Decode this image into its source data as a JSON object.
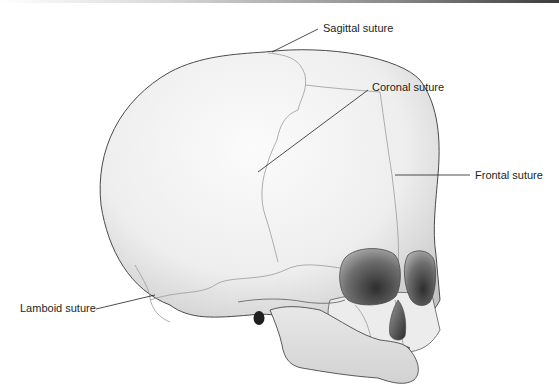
{
  "figure": {
    "labels": {
      "sagittal": "Sagittal suture",
      "coronal": "Coronal suture",
      "frontal": "Frontal suture",
      "lamboid": "Lamboid suture"
    }
  },
  "colors": {
    "background": "#ffffff",
    "bone_light": "#f4f4f4",
    "bone_shadow": "#c9c9c9",
    "outline": "#4a4a4a",
    "suture": "#9a9a9a",
    "orbit_dark": "#3a3a3a",
    "leader_line": "#231f20"
  }
}
